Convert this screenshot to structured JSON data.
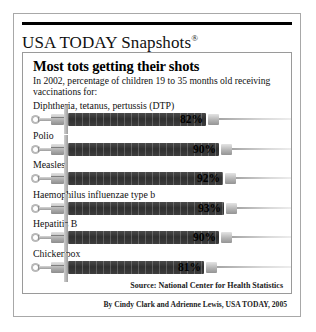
{
  "brand": {
    "name": "USA TODAY Snapshots",
    "registered_mark": "®"
  },
  "headline": "Most tots getting their shots",
  "subtitle": "In 2002, percentage of children 19 to 35 months old receiving vaccinations for:",
  "source": "Source: National Center for Health Statistics",
  "byline": "By Cindy Clark and Adrienne Lewis, USA TODAY, 2005",
  "colors": {
    "bar_fill": "#2f2f2f",
    "syringe_metal": "#b4b4b4",
    "frame": "#a8a8a8",
    "rule": "#000000",
    "text": "#111111"
  },
  "chart_data": {
    "type": "bar",
    "title": "Most tots getting their shots",
    "subtitle": "In 2002, percentage of children 19 to 35 months old receiving vaccinations for:",
    "xlabel": "",
    "ylabel": "Percentage of children vaccinated",
    "xlim": [
      0,
      100
    ],
    "unit": "%",
    "grid": false,
    "legend": false,
    "orientation": "horizontal",
    "marker_style": "syringe",
    "source": "Source: National Center for Health Statistics",
    "categories": [
      "Diphtheria, tetanus, pertussis (DTP)",
      "Polio",
      "Measles",
      "Haemophilus influenzae type b",
      "Hepatitis B",
      "Chickenpox"
    ],
    "values": [
      82,
      90,
      92,
      93,
      90,
      81
    ],
    "value_labels": [
      "82%",
      "90%",
      "92%",
      "93%",
      "90%",
      "81%"
    ]
  }
}
